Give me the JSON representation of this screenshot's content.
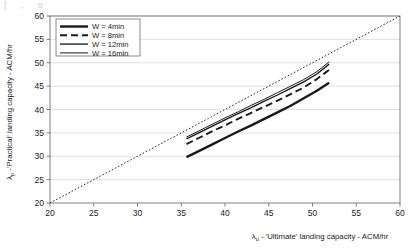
{
  "figure": {
    "top_artifact_text": "|    ,          o",
    "background_color": "#ffffff",
    "frame_color": "#6f6f6f",
    "grid_color": "#d9d9d9",
    "series_color": "#1a1a1a",
    "reference_line_color": "#2b2b2b"
  },
  "chart_data": {
    "type": "line",
    "title": "",
    "subtitle": "",
    "xlabel": "λᵤ - 'Ultimate' landing capacity - ACM/hr",
    "ylabel": "λₚ -'Practical' landing capacity - ACM/hr",
    "xlabel_lambda": "λ",
    "xlabel_subscript": "u",
    "xlabel_rest": " - 'Ultimate' landing capacity - ACM/hr",
    "ylabel_lambda": "λ",
    "ylabel_subscript": "p",
    "ylabel_rest": " -'Practical' landing capacity - ACM/hr",
    "xlim": [
      20,
      60
    ],
    "ylim": [
      20,
      60
    ],
    "xticks": [
      20,
      25,
      30,
      35,
      40,
      45,
      50,
      55,
      60
    ],
    "yticks": [
      20,
      25,
      30,
      35,
      40,
      45,
      50,
      55,
      60
    ],
    "xtick_labels": [
      "20",
      "25",
      "30",
      "35",
      "40",
      "45",
      "50",
      "55",
      "60"
    ],
    "ytick_labels": [
      "20",
      "25",
      "30",
      "35",
      "40",
      "45",
      "50",
      "55",
      "60"
    ],
    "grid": "horizontal",
    "legend_position": "top-left",
    "x": [
      35.6,
      37.0,
      38.5,
      40.0,
      41.5,
      43.0,
      44.5,
      46.0,
      47.5,
      49.0,
      50.5,
      51.9
    ],
    "series": [
      {
        "name": "W = 4min",
        "label": "W = 4min",
        "style": "solid-thick",
        "dash": "none",
        "width": 2.4,
        "values": [
          29.8,
          31.1,
          32.5,
          33.9,
          35.3,
          36.6,
          38.0,
          39.4,
          40.8,
          42.4,
          44.0,
          45.7
        ]
      },
      {
        "name": "W = 8min",
        "label": "W = 8min",
        "style": "dashed",
        "dash": "7,4",
        "width": 1.9,
        "values": [
          32.6,
          33.9,
          35.3,
          36.6,
          38.0,
          39.3,
          40.6,
          41.9,
          43.3,
          44.7,
          46.5,
          48.5
        ]
      },
      {
        "name": "W = 12min",
        "label": "W = 12min",
        "style": "solid",
        "dash": "none",
        "width": 1.35,
        "values": [
          33.7,
          35.0,
          36.4,
          37.8,
          39.1,
          40.4,
          41.8,
          43.1,
          44.5,
          45.9,
          47.6,
          49.7
        ]
      },
      {
        "name": "W = 16min",
        "label": "W = 16min",
        "style": "solid-thin",
        "dash": "none",
        "width": 1.0,
        "values": [
          34.1,
          35.4,
          36.8,
          38.2,
          39.5,
          40.9,
          42.2,
          43.6,
          45.0,
          46.4,
          48.1,
          50.2
        ]
      }
    ],
    "reference_line": {
      "name": "y = x reference",
      "label": "",
      "style": "dotted",
      "x": [
        20,
        60
      ],
      "values": [
        20,
        60
      ]
    }
  },
  "legend": {
    "items": [
      {
        "label": "W = 4min"
      },
      {
        "label": "W = 8min"
      },
      {
        "label": "W = 12min"
      },
      {
        "label": "W = 16min"
      }
    ]
  }
}
